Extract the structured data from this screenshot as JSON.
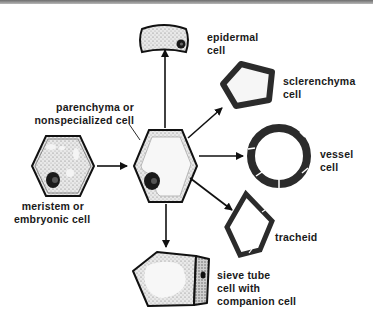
{
  "diagram": {
    "type": "cell-differentiation",
    "origin": {
      "id": "meristem",
      "label_line1": "meristem or",
      "label_line2": "embryonic cell"
    },
    "intermediate": {
      "id": "parenchyma",
      "label_line1": "parenchyma or",
      "label_line2": "nonspecialized cell"
    },
    "derived": [
      {
        "id": "epidermal",
        "label_line1": "epidermal",
        "label_line2": "cell"
      },
      {
        "id": "sclerenchyma",
        "label_line1": "sclerenchyma",
        "label_line2": "cell"
      },
      {
        "id": "vessel",
        "label_line1": "vessel",
        "label_line2": "cell"
      },
      {
        "id": "tracheid",
        "label_line1": "tracheid",
        "label_line2": ""
      },
      {
        "id": "sieve-tube",
        "label_line1": "sieve tube",
        "label_line2": "cell with",
        "label_line3": "companion cell"
      }
    ],
    "colors": {
      "outline": "#111111",
      "stipple": "#9a9a9a",
      "wall": "#2b2b2b",
      "background": "#ffffff"
    }
  }
}
